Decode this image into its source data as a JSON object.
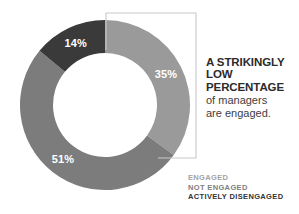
{
  "chart_data": {
    "type": "pie",
    "variant": "donut",
    "title": "",
    "categories": [
      "Engaged",
      "Not engaged",
      "Actively disengaged"
    ],
    "values": [
      35,
      51,
      14
    ],
    "value_labels": [
      "35%",
      "51%",
      "14%"
    ],
    "colors": [
      "#9a9a9a",
      "#7c7c7c",
      "#3a3a3a"
    ],
    "units": "percent",
    "total": 100,
    "start_angle_deg": 0,
    "direction": "clockwise",
    "legend_position": "bottom-right",
    "grid": false,
    "annotation": "A STRIKINGLY LOW PERCENTAGE of managers are engaged.",
    "annotation_target": "Engaged",
    "slices": [
      {
        "label": "Engaged",
        "value": 35,
        "display": "35%",
        "color": "#9a9a9a",
        "label_color": "#ffffff"
      },
      {
        "label": "Not engaged",
        "value": 51,
        "display": "51%",
        "color": "#7c7c7c",
        "label_color": "#ffffff"
      },
      {
        "label": "Actively disengaged",
        "value": 14,
        "display": "14%",
        "color": "#3a3a3a",
        "label_color": "#ffffff"
      }
    ]
  },
  "headline": {
    "strong_line_1": "A STRIKINGLY",
    "strong_line_2": "LOW",
    "strong_line_3": "PERCENTAGE",
    "rest_line_1": "of managers",
    "rest_line_2": "are engaged."
  },
  "legend": {
    "items": [
      {
        "label": "ENGAGED",
        "color": "#a3a3a3"
      },
      {
        "label": "NOT ENGAGED",
        "color": "#808080"
      },
      {
        "label": "ACTIVELY DISENGAGED",
        "color": "#333333"
      }
    ]
  },
  "callout": {
    "bracket_color": "#c9c9c9"
  }
}
